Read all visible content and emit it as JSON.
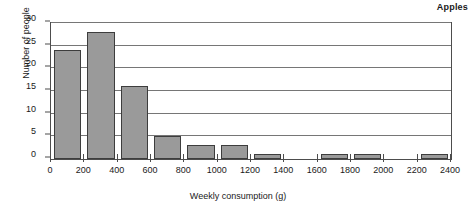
{
  "chart_data": {
    "type": "bar",
    "title": "Apples",
    "xlabel": "Weekly consumption (g)",
    "ylabel": "Number of people",
    "xlim": [
      0,
      2400
    ],
    "ylim": [
      0,
      30
    ],
    "grid": true,
    "legend": "none",
    "bin_width": 200,
    "categories": [
      "0-200",
      "200-400",
      "400-600",
      "600-800",
      "800-1000",
      "1000-1200",
      "1200-1400",
      "1400-1600",
      "1600-1800",
      "1800-2000",
      "2000-2200",
      "2200-2400"
    ],
    "bin_starts": [
      0,
      200,
      400,
      600,
      800,
      1000,
      1200,
      1400,
      1600,
      1800,
      2000,
      2200
    ],
    "values": [
      24,
      28,
      16,
      5,
      3,
      3,
      1,
      0,
      1,
      1,
      0,
      1
    ],
    "x_ticks": [
      0,
      200,
      400,
      600,
      800,
      1000,
      1200,
      1400,
      1600,
      1800,
      2000,
      2200,
      2400
    ],
    "x_tick_labels": [
      "0",
      "200",
      "400",
      "600",
      "800",
      "1000",
      "1200",
      "1400",
      "1600",
      "1800",
      "2000",
      "2200",
      "2400"
    ],
    "y_ticks": [
      0,
      5,
      10,
      15,
      20,
      25,
      30
    ],
    "y_tick_labels": [
      "0",
      "5",
      "10",
      "15",
      "20",
      "25",
      "30"
    ],
    "colors": {
      "bar_fill": "#9a9a9a",
      "bar_edge": "#3d3d3d",
      "gridline": "#767676",
      "axis": "#4d4d4d",
      "text": "#1a1a1a",
      "background": "#ffffff"
    }
  }
}
